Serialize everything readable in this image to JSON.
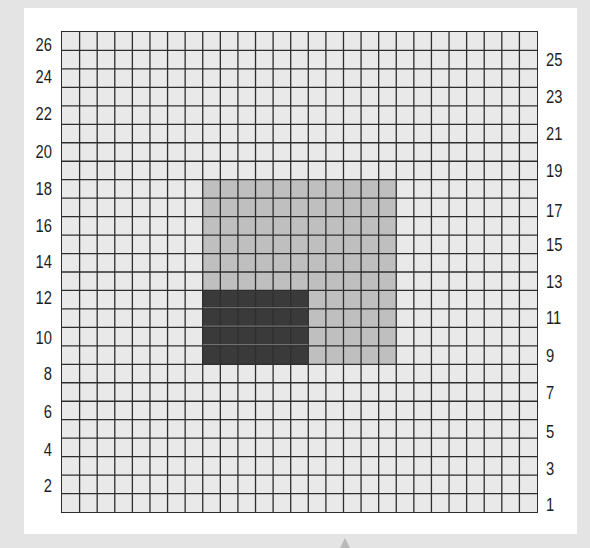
{
  "chart_data": {
    "type": "grid-diagram",
    "grid": {
      "columns": 27,
      "rows": 26
    },
    "left_axis_labels": [
      "26",
      "24",
      "22",
      "20",
      "18",
      "16",
      "14",
      "12",
      "10",
      "8",
      "6",
      "4",
      "2"
    ],
    "right_axis_labels": [
      "25",
      "23",
      "21",
      "19",
      "17",
      "15",
      "13",
      "11",
      "9",
      "7",
      "5",
      "3",
      "1"
    ],
    "regions": [
      {
        "name": "light-region",
        "col_start": 8,
        "col_span": 11,
        "row_start": 8,
        "row_span": 10,
        "color": "#bfbfbf"
      },
      {
        "name": "dark-region",
        "col_start": 8,
        "col_span": 6,
        "row_start": 14,
        "row_span": 4,
        "color": "#3a3a3a"
      }
    ],
    "colors": {
      "cell": "#e9e9e9",
      "line": "#2e2e2e",
      "panel": "#ffffff",
      "background": "#e4e4e4"
    }
  },
  "labels": {
    "left": [
      {
        "text": "26",
        "y": 45
      },
      {
        "text": "24",
        "y": 77
      },
      {
        "text": "22",
        "y": 114
      },
      {
        "text": "20",
        "y": 152
      },
      {
        "text": "18",
        "y": 189
      },
      {
        "text": "16",
        "y": 226
      },
      {
        "text": "14",
        "y": 262
      },
      {
        "text": "12",
        "y": 298
      },
      {
        "text": "10",
        "y": 338
      },
      {
        "text": "8",
        "y": 374
      },
      {
        "text": "6",
        "y": 412
      },
      {
        "text": "4",
        "y": 450
      },
      {
        "text": "2",
        "y": 486
      }
    ],
    "right": [
      {
        "text": "25",
        "y": 60
      },
      {
        "text": "23",
        "y": 97
      },
      {
        "text": "21",
        "y": 134
      },
      {
        "text": "19",
        "y": 171
      },
      {
        "text": "17",
        "y": 211
      },
      {
        "text": "15",
        "y": 245
      },
      {
        "text": "13",
        "y": 282
      },
      {
        "text": "11",
        "y": 318
      },
      {
        "text": "9",
        "y": 356
      },
      {
        "text": "7",
        "y": 393
      },
      {
        "text": "5",
        "y": 432
      },
      {
        "text": "3",
        "y": 469
      },
      {
        "text": "1",
        "y": 505
      }
    ]
  }
}
